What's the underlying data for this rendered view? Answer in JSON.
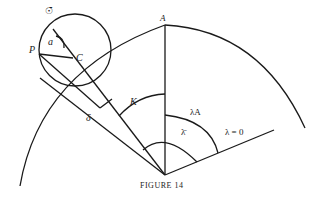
{
  "figure": {
    "caption": "FIGURE 14",
    "labels": {
      "sun": "☉̄",
      "P": "P",
      "a": "a",
      "C": "C",
      "A": "A",
      "K": "K",
      "delta": "δ",
      "lambdaA": "λA",
      "lambda_bar": "λ̄",
      "lambda_zero": "λ = 0"
    },
    "colors": {
      "stroke": "#1a1a1a",
      "text": "#222222"
    }
  }
}
